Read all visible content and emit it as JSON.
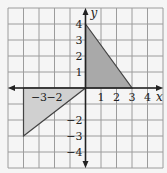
{
  "figure": {
    "background": "#f5f5f5",
    "grid_color": "#9c9c9c",
    "axis_color": "#222222"
  },
  "chart_data": {
    "type": "diagram",
    "title": "",
    "xlabel": "x",
    "ylabel": "y",
    "xlim": [
      -5,
      5
    ],
    "ylim": [
      -5,
      5
    ],
    "grid": true,
    "x_tick_labels": [
      "-3",
      "-2",
      "1",
      "2",
      "3",
      "4"
    ],
    "x_ticks": [
      -3,
      -2,
      1,
      2,
      3,
      4
    ],
    "y_tick_labels": [
      "4",
      "3",
      "2",
      "1",
      "-2",
      "-3",
      "-4"
    ],
    "y_ticks": [
      4,
      3,
      2,
      1,
      -2,
      -3,
      -4
    ],
    "shapes": [
      {
        "name": "triangle-first-quadrant",
        "vertices": [
          [
            0,
            0
          ],
          [
            0,
            4
          ],
          [
            3,
            0
          ]
        ],
        "fill": "#a9a9a9"
      },
      {
        "name": "triangle-third-quadrant",
        "vertices": [
          [
            0,
            0
          ],
          [
            -4,
            0
          ],
          [
            -4,
            -3
          ]
        ],
        "fill": "#d0d0d0"
      }
    ]
  }
}
